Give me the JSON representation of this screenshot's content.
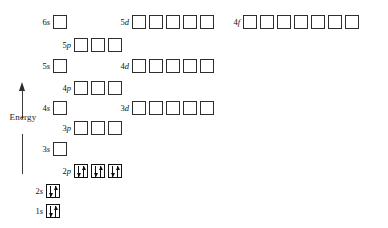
{
  "figure": {
    "kind": "orbital-energy-level-diagram",
    "background_color": "#ffffff",
    "box_border_color": "#2e2e2e",
    "arrow_color": "#0d0d0d"
  },
  "axis": {
    "label": "Energy",
    "direction": "up",
    "arrow_icon": "up-arrow-icon"
  },
  "rows": [
    {
      "id": "6s",
      "label": "6s",
      "n": "6",
      "subshell": "s",
      "box_count": 1,
      "filled": 0,
      "electrons": [],
      "x": 53,
      "y": 14
    },
    {
      "id": "5d",
      "label": "5d",
      "n": "5",
      "subshell": "d",
      "box_count": 5,
      "filled": 0,
      "electrons": [],
      "x": 132,
      "y": 14
    },
    {
      "id": "4f",
      "label": "4f",
      "n": "4",
      "subshell": "f",
      "box_count": 7,
      "filled": 0,
      "electrons": [],
      "x": 243,
      "y": 14
    },
    {
      "id": "5p",
      "label": "5p",
      "n": "5",
      "subshell": "p",
      "box_count": 3,
      "filled": 0,
      "electrons": [],
      "x": 74,
      "y": 37
    },
    {
      "id": "5s",
      "label": "5s",
      "n": "5",
      "subshell": "s",
      "box_count": 1,
      "filled": 0,
      "electrons": [],
      "x": 53,
      "y": 58
    },
    {
      "id": "4d",
      "label": "4d",
      "n": "4",
      "subshell": "d",
      "box_count": 5,
      "filled": 0,
      "electrons": [],
      "x": 132,
      "y": 58
    },
    {
      "id": "4p",
      "label": "4p",
      "n": "4",
      "subshell": "p",
      "box_count": 3,
      "filled": 0,
      "electrons": [],
      "x": 74,
      "y": 80
    },
    {
      "id": "4s",
      "label": "4s",
      "n": "4",
      "subshell": "s",
      "box_count": 1,
      "filled": 0,
      "electrons": [],
      "x": 53,
      "y": 100
    },
    {
      "id": "3d",
      "label": "3d",
      "n": "3",
      "subshell": "d",
      "box_count": 5,
      "filled": 0,
      "electrons": [],
      "x": 132,
      "y": 100
    },
    {
      "id": "3p",
      "label": "3p",
      "n": "3",
      "subshell": "p",
      "box_count": 3,
      "filled": 0,
      "electrons": [],
      "x": 74,
      "y": 120
    },
    {
      "id": "3s",
      "label": "3s",
      "n": "3",
      "subshell": "s",
      "box_count": 1,
      "filled": 0,
      "electrons": [],
      "x": 53,
      "y": 141
    },
    {
      "id": "2p",
      "label": "2p",
      "n": "2",
      "subshell": "p",
      "box_count": 3,
      "filled": 3,
      "electrons": [
        "up-down",
        "up-down",
        "up-down"
      ],
      "x": 74,
      "y": 163
    },
    {
      "id": "2s",
      "label": "2s",
      "n": "2",
      "subshell": "s",
      "box_count": 1,
      "filled": 1,
      "electrons": [
        "up-down"
      ],
      "x": 46,
      "y": 183
    },
    {
      "id": "1s",
      "label": "1s",
      "n": "1",
      "subshell": "s",
      "box_count": 1,
      "filled": 1,
      "electrons": [
        "up-down"
      ],
      "x": 46,
      "y": 203
    }
  ],
  "chart_data": {
    "type": "bar",
    "xlabel": "",
    "ylabel": "Energy",
    "categories": [
      "1s",
      "2s",
      "2p",
      "3s",
      "3p",
      "4s",
      "3d",
      "4p",
      "5s",
      "4d",
      "5p",
      "6s",
      "5d",
      "4f"
    ],
    "series": [
      {
        "name": "relative energy (row y-position, lower = lower energy)",
        "values": [
          203,
          183,
          163,
          141,
          120,
          100,
          100,
          80,
          58,
          58,
          37,
          14,
          14,
          14
        ]
      },
      {
        "name": "orbital boxes",
        "values": [
          1,
          1,
          3,
          1,
          3,
          1,
          5,
          3,
          1,
          5,
          3,
          1,
          5,
          7
        ]
      },
      {
        "name": "electrons occupied",
        "values": [
          2,
          2,
          6,
          0,
          0,
          0,
          0,
          0,
          0,
          0,
          0,
          0,
          0,
          0
        ]
      }
    ],
    "grid": false,
    "legend": "none"
  }
}
